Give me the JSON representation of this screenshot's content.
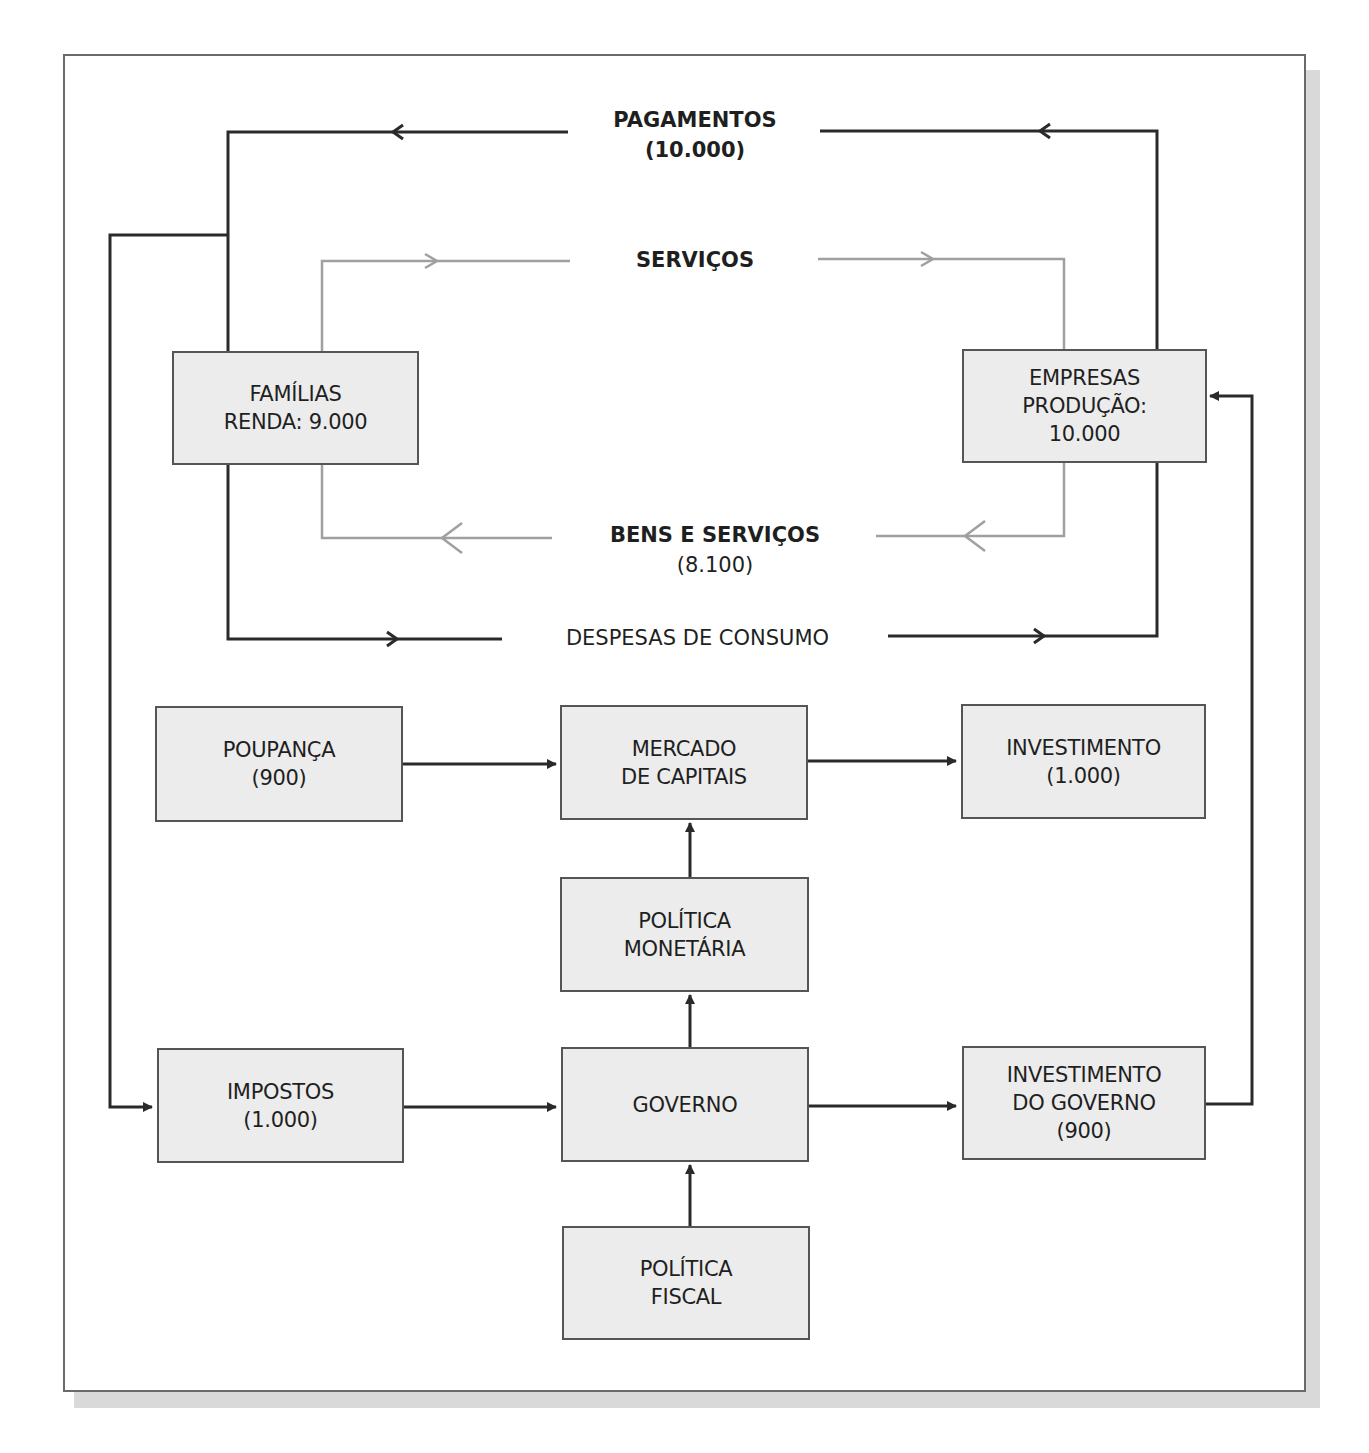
{
  "diagram": {
    "colors": {
      "box_fill": "#ececec",
      "box_border": "#555555",
      "dark_line": "#2a2a2a",
      "gray_line": "#a0a0a0",
      "background": "#ffffff",
      "shadow": "#d9d9d9"
    },
    "flows": {
      "pagamentos": {
        "title": "PAGAMENTOS",
        "value": "(10.000)"
      },
      "servicos": {
        "title": "SERVIÇOS"
      },
      "bens_servicos": {
        "title": "BENS E SERVIÇOS",
        "value": "(8.100)"
      },
      "despesas": {
        "title": "DESPESAS DE CONSUMO"
      }
    },
    "nodes": {
      "familias": {
        "line1": "FAMÍLIAS",
        "line2": "RENDA: 9.000"
      },
      "empresas": {
        "line1": "EMPRESAS",
        "line2": "PRODUÇÃO:",
        "line3": "10.000"
      },
      "poupanca": {
        "line1": "POUPANÇA",
        "line2": "(900)"
      },
      "mercado": {
        "line1": "MERCADO",
        "line2": "DE CAPITAIS"
      },
      "investimento": {
        "line1": "INVESTIMENTO",
        "line2": "(1.000)"
      },
      "politica_monetaria": {
        "line1": "POLÍTICA",
        "line2": "MONETÁRIA"
      },
      "impostos": {
        "line1": "IMPOSTOS",
        "line2": "(1.000)"
      },
      "governo": {
        "line1": "GOVERNO"
      },
      "investimento_governo": {
        "line1": "INVESTIMENTO",
        "line2": "DO GOVERNO",
        "line3": "(900)"
      },
      "politica_fiscal": {
        "line1": "POLÍTICA",
        "line2": "FISCAL"
      }
    },
    "edges": [
      {
        "from": "empresas",
        "to": "familias",
        "label": "PAGAMENTOS (10.000)"
      },
      {
        "from": "familias",
        "to": "empresas",
        "label": "SERVIÇOS"
      },
      {
        "from": "empresas",
        "to": "familias",
        "label": "BENS E SERVIÇOS (8.100)"
      },
      {
        "from": "familias",
        "to": "empresas",
        "label": "DESPESAS DE CONSUMO"
      },
      {
        "from": "familias",
        "to": "impostos",
        "label": ""
      },
      {
        "from": "poupanca",
        "to": "mercado",
        "label": ""
      },
      {
        "from": "mercado",
        "to": "investimento",
        "label": ""
      },
      {
        "from": "politica_monetaria",
        "to": "mercado",
        "label": ""
      },
      {
        "from": "governo",
        "to": "politica_monetaria",
        "label": ""
      },
      {
        "from": "impostos",
        "to": "governo",
        "label": ""
      },
      {
        "from": "governo",
        "to": "investimento_governo",
        "label": ""
      },
      {
        "from": "politica_fiscal",
        "to": "governo",
        "label": ""
      },
      {
        "from": "investimento_governo",
        "to": "empresas",
        "label": ""
      }
    ]
  }
}
